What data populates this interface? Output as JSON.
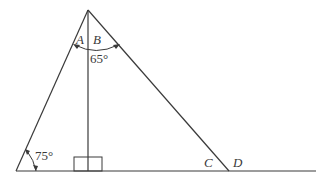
{
  "diagram": {
    "type": "geometry-triangle-with-altitude",
    "stroke_color": "#3a3a3a",
    "background": "#ffffff",
    "points": {
      "apex": {
        "x": 88,
        "y": 10
      },
      "left_base": {
        "x": 16,
        "y": 171
      },
      "altitude_foot": {
        "x": 88,
        "y": 171
      },
      "right_base": {
        "x": 229,
        "y": 171
      },
      "baseline_end": {
        "x": 316,
        "y": 171
      }
    },
    "labels": {
      "angle_a": "A",
      "angle_b": "B",
      "angle_apex_value": "65°",
      "angle_left_value": "75°",
      "point_c": "C",
      "point_d": "D"
    },
    "annotations": {
      "right_angle_marker": true
    }
  }
}
